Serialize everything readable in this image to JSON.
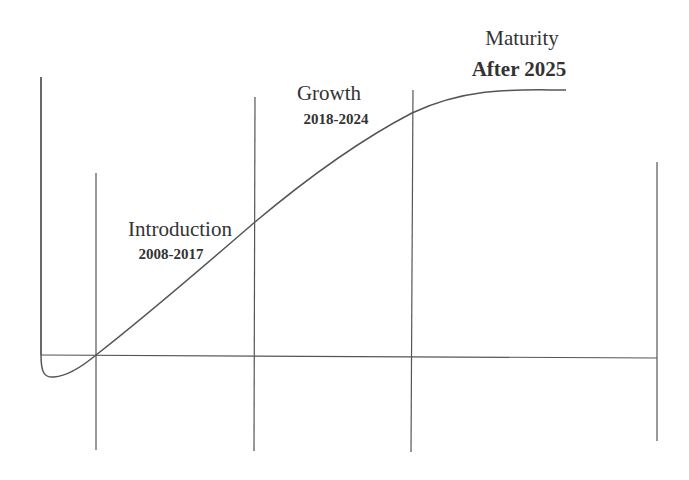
{
  "diagram": {
    "type": "product-life-cycle-curve",
    "stages": [
      {
        "name": "Introduction",
        "years": "2008-2017"
      },
      {
        "name": "Growth",
        "years": "2018-2024"
      },
      {
        "name": "Maturity",
        "years": "After 2025"
      }
    ],
    "colors": {
      "line": "#555555",
      "text": "#333333",
      "background": "#ffffff"
    }
  }
}
